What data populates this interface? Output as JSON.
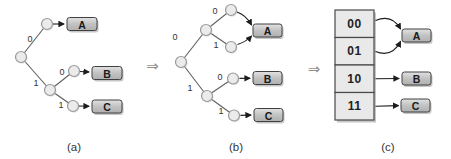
{
  "figure": {
    "type": "diagram",
    "colors": {
      "background": "#ffffff",
      "edge": "#5f5f5f",
      "arrow": "#1c1c1c",
      "node_fill": "#ebebeb",
      "node_stroke": "#999999",
      "box_top": "#e2e2e2",
      "box_mid": "#c2c2c2",
      "box_bottom": "#b0b0b0",
      "box_stroke": "#404040",
      "box_text": "#1a1a1a",
      "cell_fill": "#e9e9e9",
      "cell_stroke": "#4a4a4a",
      "label_text": "#333333",
      "shadow": "#c6c6c6",
      "implies": "#8f8f8f"
    },
    "code_assignments": [
      {
        "code": "00",
        "symbol": "A"
      },
      {
        "code": "01",
        "symbol": "A"
      },
      {
        "code": "10",
        "symbol": "B"
      },
      {
        "code": "11",
        "symbol": "C"
      }
    ],
    "implies": [
      {
        "symbol": "⇒",
        "x": 152.5,
        "y": 65.5
      },
      {
        "symbol": "⇒",
        "x": 314,
        "y": 69
      }
    ],
    "captions": [
      {
        "text": "(a)",
        "x": 74,
        "y": 147
      },
      {
        "text": "(b)",
        "x": 236,
        "y": 147
      },
      {
        "text": "(c)",
        "x": 388,
        "y": 147
      }
    ],
    "trees": [
      {
        "name": "tree-a",
        "nodes": [
          [
            21,
            57
          ],
          [
            47,
            24
          ],
          [
            50,
            90
          ],
          [
            74,
            71
          ],
          [
            73,
            106
          ]
        ],
        "edges": [
          {
            "from": [
              21,
              57
            ],
            "to": [
              47,
              24
            ],
            "label": "0",
            "lx": 30,
            "ly": 39
          },
          {
            "from": [
              21,
              57
            ],
            "to": [
              50,
              90
            ],
            "label": "1",
            "lx": 36,
            "ly": 83
          },
          {
            "from": [
              50,
              90
            ],
            "to": [
              74,
              71
            ],
            "label": "0",
            "lx": 62,
            "ly": 72
          },
          {
            "from": [
              50,
              90
            ],
            "to": [
              73,
              106
            ],
            "label": "1",
            "lx": 61,
            "ly": 105
          }
        ],
        "arrows": [
          {
            "d": "M 53 24 L 64 24"
          },
          {
            "d": "M 80 71.5 L 89 72"
          },
          {
            "d": "M 79 106 L 89 106.3"
          }
        ],
        "boxes": [
          {
            "label": "A",
            "x": 67,
            "y": 17.5,
            "w": 30,
            "h": 13
          },
          {
            "label": "B",
            "x": 92,
            "y": 66.5,
            "w": 30,
            "h": 13
          },
          {
            "label": "C",
            "x": 92,
            "y": 100,
            "w": 30,
            "h": 13
          }
        ]
      },
      {
        "name": "tree-b",
        "nodes": [
          [
            181,
            62
          ],
          [
            206,
            30
          ],
          [
            231,
            10
          ],
          [
            231,
            47
          ],
          [
            207,
            96
          ],
          [
            233,
            78.5
          ],
          [
            234,
            115.5
          ]
        ],
        "edges": [
          {
            "from": [
              181,
              62
            ],
            "to": [
              206,
              30
            ],
            "label": "0",
            "lx": 175,
            "ly": 37
          },
          {
            "from": [
              206,
              30
            ],
            "to": [
              231,
              10
            ],
            "label": "0",
            "lx": 215,
            "ly": 11
          },
          {
            "from": [
              206,
              30
            ],
            "to": [
              231,
              47
            ],
            "label": "1",
            "lx": 216,
            "ly": 45
          },
          {
            "from": [
              181,
              62
            ],
            "to": [
              207,
              96
            ],
            "label": "1",
            "lx": 190,
            "ly": 88
          },
          {
            "from": [
              207,
              96
            ],
            "to": [
              233,
              78.5
            ],
            "label": "0",
            "lx": 220,
            "ly": 77
          },
          {
            "from": [
              207,
              96
            ],
            "to": [
              234,
              115.5
            ],
            "label": "1",
            "lx": 221,
            "ly": 111
          }
        ],
        "arrows": [
          {
            "d": "M 237 12 Q 246 15 251.5 25"
          },
          {
            "d": "M 237.5 44.5 Q 246.5 41.5 251.5 36"
          },
          {
            "d": "M 239.5 78.4 L 250 78.2"
          },
          {
            "d": "M 240.5 115.4 L 251 115"
          }
        ],
        "boxes": [
          {
            "label": "A",
            "x": 253,
            "y": 24,
            "w": 29,
            "h": 13
          },
          {
            "label": "B",
            "x": 253,
            "y": 71.5,
            "w": 29,
            "h": 13
          },
          {
            "label": "C",
            "x": 254,
            "y": 108.5,
            "w": 29,
            "h": 13
          }
        ]
      }
    ],
    "table": {
      "name": "code-table-c",
      "x": 335,
      "y": 10,
      "w": 39,
      "row_h": 27.5,
      "cells": [
        "00",
        "01",
        "10",
        "11"
      ],
      "arrows": [
        {
          "d": "M 375.5 20.5 Q 392 13.5 400.5 29"
        },
        {
          "d": "M 375.5 51.5 Q 392 58 400.5 41.5"
        },
        {
          "d": "M 375.5 78.7 L 399 78.5"
        },
        {
          "d": "M 375.5 106.2 L 398.5 105.6"
        }
      ],
      "boxes": [
        {
          "label": "A",
          "x": 402,
          "y": 29,
          "w": 29,
          "h": 13
        },
        {
          "label": "B",
          "x": 402,
          "y": 72,
          "w": 29,
          "h": 13
        },
        {
          "label": "C",
          "x": 401,
          "y": 99,
          "w": 29,
          "h": 13
        }
      ]
    }
  }
}
